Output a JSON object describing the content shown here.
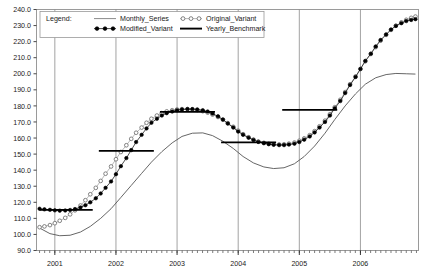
{
  "chart_data": {
    "type": "line",
    "title": "",
    "xlabel": "",
    "ylabel": "",
    "xlim": [
      2000.7,
      2006.95
    ],
    "ylim": [
      90.0,
      240.0
    ],
    "grid": "vertical-yearly",
    "legend_position": "top-inside",
    "legend_title": "Legend:",
    "y_ticks": [
      "90.0",
      "100.0",
      "110.0",
      "120.0",
      "130.0",
      "140.0",
      "150.0",
      "160.0",
      "170.0",
      "180.0",
      "190.0",
      "200.0",
      "210.0",
      "220.0",
      "230.0",
      "240.0"
    ],
    "y_tick_values": [
      90,
      100,
      110,
      120,
      130,
      140,
      150,
      160,
      170,
      180,
      190,
      200,
      210,
      220,
      230,
      240
    ],
    "x_ticks": [
      "2001",
      "2002",
      "2003",
      "2004",
      "2005",
      "2006"
    ],
    "x_tick_values": [
      2001,
      2002,
      2003,
      2004,
      2005,
      2006
    ],
    "series": [
      {
        "name": "Monthly_Series",
        "marker": "none",
        "style": "thin-line",
        "color": "#555555",
        "x": [
          2000.75,
          2000.92,
          2001.08,
          2001.25,
          2001.42,
          2001.58,
          2001.75,
          2001.92,
          2002.08,
          2002.25,
          2002.42,
          2002.58,
          2002.75,
          2002.92,
          2003.08,
          2003.25,
          2003.42,
          2003.58,
          2003.75,
          2003.92,
          2004.08,
          2004.25,
          2004.42,
          2004.58,
          2004.75,
          2004.92,
          2005.08,
          2005.25,
          2005.42,
          2005.58,
          2005.75,
          2005.92,
          2006.08,
          2006.25,
          2006.42,
          2006.58,
          2006.75,
          2006.9
        ],
        "values": [
          104.0,
          100.5,
          99.2,
          99.5,
          101.5,
          105.0,
          110.0,
          116.0,
          123.0,
          130.5,
          138.0,
          145.0,
          151.5,
          157.0,
          161.0,
          163.0,
          163.2,
          161.5,
          158.0,
          153.5,
          148.5,
          144.5,
          142.0,
          141.0,
          141.5,
          144.0,
          148.5,
          155.0,
          163.0,
          171.5,
          180.0,
          187.5,
          193.5,
          197.5,
          199.5,
          200.2,
          200.0,
          199.8
        ]
      },
      {
        "name": "Modified_Variant",
        "marker": "filled-circle",
        "style": "line-with-markers",
        "color": "#000000",
        "x": [
          2000.75,
          2000.83,
          2000.92,
          2001.0,
          2001.08,
          2001.17,
          2001.25,
          2001.33,
          2001.42,
          2001.5,
          2001.58,
          2001.67,
          2001.75,
          2001.83,
          2001.92,
          2002.0,
          2002.08,
          2002.17,
          2002.25,
          2002.33,
          2002.42,
          2002.5,
          2002.58,
          2002.67,
          2002.75,
          2002.83,
          2002.92,
          2003.0,
          2003.08,
          2003.17,
          2003.25,
          2003.33,
          2003.42,
          2003.5,
          2003.58,
          2003.67,
          2003.75,
          2003.83,
          2003.92,
          2004.0,
          2004.08,
          2004.17,
          2004.25,
          2004.33,
          2004.42,
          2004.5,
          2004.58,
          2004.67,
          2004.75,
          2004.83,
          2004.92,
          2005.0,
          2005.08,
          2005.17,
          2005.25,
          2005.33,
          2005.42,
          2005.5,
          2005.58,
          2005.67,
          2005.75,
          2005.83,
          2005.92,
          2006.0,
          2006.08,
          2006.17,
          2006.25,
          2006.33,
          2006.42,
          2006.5,
          2006.58,
          2006.67,
          2006.75,
          2006.83,
          2006.9
        ],
        "values": [
          116.0,
          115.6,
          115.3,
          115.0,
          114.8,
          114.9,
          115.2,
          115.8,
          116.8,
          118.2,
          120.0,
          122.5,
          125.5,
          129.0,
          133.0,
          137.5,
          142.5,
          147.5,
          152.5,
          157.5,
          162.0,
          166.0,
          169.5,
          172.0,
          174.0,
          175.5,
          176.5,
          177.3,
          177.8,
          178.0,
          178.0,
          177.8,
          177.3,
          176.5,
          175.2,
          173.5,
          171.5,
          169.0,
          166.5,
          164.0,
          162.0,
          160.2,
          158.8,
          157.6,
          156.8,
          156.2,
          155.8,
          155.6,
          155.6,
          155.9,
          156.5,
          157.5,
          159.0,
          161.0,
          163.5,
          166.5,
          170.0,
          174.0,
          178.5,
          183.0,
          188.0,
          193.0,
          198.0,
          203.0,
          208.0,
          212.5,
          217.0,
          221.0,
          224.5,
          227.5,
          229.8,
          231.5,
          232.8,
          233.5,
          234.0
        ]
      },
      {
        "name": "Original_Variant",
        "marker": "open-circle",
        "style": "line-with-markers",
        "color": "#777777",
        "x": [
          2000.75,
          2000.83,
          2000.92,
          2001.0,
          2001.08,
          2001.17,
          2001.25,
          2001.33,
          2001.42,
          2001.5,
          2001.58,
          2001.67,
          2001.75,
          2001.83,
          2001.92,
          2002.0,
          2002.08,
          2002.17,
          2002.25,
          2002.33,
          2002.42,
          2002.5,
          2002.58,
          2002.67,
          2002.75,
          2002.83,
          2002.92,
          2003.0,
          2003.08,
          2003.17,
          2003.25,
          2003.33,
          2003.42,
          2003.5,
          2003.58,
          2003.67,
          2003.75,
          2003.83,
          2003.92,
          2004.0,
          2004.08,
          2004.17,
          2004.25,
          2004.33,
          2004.42,
          2004.5,
          2004.58,
          2004.67,
          2004.75,
          2004.83,
          2004.92,
          2005.0,
          2005.08,
          2005.17,
          2005.25,
          2005.33,
          2005.42,
          2005.5,
          2005.58,
          2005.67,
          2005.75,
          2005.83,
          2005.92,
          2006.0,
          2006.08,
          2006.17,
          2006.25,
          2006.33,
          2006.42,
          2006.5,
          2006.58,
          2006.67,
          2006.75,
          2006.83,
          2006.9
        ],
        "values": [
          104.5,
          105.0,
          105.8,
          107.0,
          108.5,
          110.3,
          112.5,
          115.0,
          118.0,
          121.3,
          125.0,
          129.0,
          133.3,
          137.8,
          142.3,
          146.8,
          151.3,
          155.5,
          159.5,
          163.3,
          166.5,
          169.5,
          172.0,
          174.0,
          175.5,
          176.6,
          177.3,
          177.8,
          178.0,
          178.0,
          177.8,
          177.4,
          176.7,
          175.8,
          174.6,
          173.1,
          171.4,
          169.3,
          167.0,
          164.6,
          162.4,
          160.5,
          159.0,
          157.8,
          157.0,
          156.4,
          156.1,
          156.0,
          156.1,
          156.5,
          157.2,
          158.3,
          159.8,
          161.8,
          164.3,
          167.3,
          170.8,
          174.8,
          179.2,
          183.8,
          188.6,
          193.5,
          198.3,
          203.0,
          207.8,
          212.3,
          216.6,
          220.6,
          224.2,
          227.3,
          229.9,
          232.0,
          233.6,
          234.8,
          235.6
        ]
      },
      {
        "name": "Yearly_Benchmark",
        "marker": "none",
        "style": "thick-step-segments",
        "color": "#000000",
        "segments": [
          {
            "label": "2001",
            "x_start": 2000.75,
            "x_end": 2001.62,
            "value": 115.3
          },
          {
            "label": "2002",
            "x_start": 2001.72,
            "x_end": 2002.62,
            "value": 152.0
          },
          {
            "label": "2003",
            "x_start": 2002.72,
            "x_end": 2003.62,
            "value": 176.3
          },
          {
            "label": "2004",
            "x_start": 2003.72,
            "x_end": 2004.62,
            "value": 157.3
          },
          {
            "label": "2005",
            "x_start": 2004.72,
            "x_end": 2005.62,
            "value": 177.5
          }
        ]
      }
    ]
  },
  "legend": {
    "title": "Legend:",
    "entries": [
      {
        "label": "Monthly_Series",
        "glyph": "thin-line-swatch"
      },
      {
        "label": "Modified_Variant",
        "glyph": "filled-circle-swatch"
      },
      {
        "label": "Original_Variant",
        "glyph": "open-circle-swatch"
      },
      {
        "label": "Yearly_Benchmark",
        "glyph": "thick-line-swatch"
      }
    ]
  }
}
